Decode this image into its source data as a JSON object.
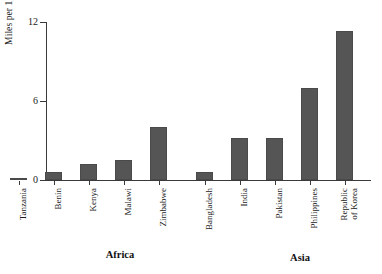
{
  "chart_data": {
    "type": "bar",
    "title": "",
    "subtitle": "",
    "xlabel": "",
    "ylabel": "Miles per 1,000 hectares",
    "ylim": [
      0,
      12
    ],
    "yticks": [
      0,
      6,
      12
    ],
    "ytick_labels": [
      "0",
      "6",
      "12"
    ],
    "grid": false,
    "legend": false,
    "bar_color": "#555555",
    "categories": [
      "Tanzania",
      "Benin",
      "Kenya",
      "Malawi",
      "Zimbabwe",
      "Bangladesh",
      "India",
      "Pakistan",
      "Philippines",
      "Republic of Korea"
    ],
    "values": [
      0.15,
      0.6,
      1.2,
      1.5,
      4.0,
      0.6,
      3.2,
      3.2,
      7.0,
      11.3
    ],
    "groups": [
      {
        "label": "Africa",
        "categories": [
          "Tanzania",
          "Benin",
          "Kenya",
          "Malawi",
          "Zimbabwe"
        ]
      },
      {
        "label": "Asia",
        "categories": [
          "Bangladesh",
          "India",
          "Pakistan",
          "Philippines",
          "Republic of Korea"
        ]
      }
    ]
  },
  "axis": {
    "y_label": "Miles per 1,000 hectares",
    "y_ticks": [
      {
        "value": 12,
        "label": "12"
      },
      {
        "value": 6,
        "label": "6"
      },
      {
        "value": 0,
        "label": "0"
      }
    ]
  },
  "bars": [
    {
      "name": "Tanzania",
      "label": "Tanzania",
      "label_line2": "",
      "value": 0.15
    },
    {
      "name": "Benin",
      "label": "Benin",
      "label_line2": "",
      "value": 0.6
    },
    {
      "name": "Kenya",
      "label": "Kenya",
      "label_line2": "",
      "value": 1.2
    },
    {
      "name": "Malawi",
      "label": "Malawi",
      "label_line2": "",
      "value": 1.5
    },
    {
      "name": "Zimbabwe",
      "label": "Zimbabwe",
      "label_line2": "",
      "value": 4.0
    },
    {
      "name": "Bangladesh",
      "label": "Bangladesh",
      "label_line2": "",
      "value": 0.6
    },
    {
      "name": "India",
      "label": "India",
      "label_line2": "",
      "value": 3.2
    },
    {
      "name": "Pakistan",
      "label": "Pakistan",
      "label_line2": "",
      "value": 3.2
    },
    {
      "name": "Philippines",
      "label": "Philippines",
      "label_line2": "",
      "value": 7.0
    },
    {
      "name": "Republic of Korea",
      "label": "Republic",
      "label_line2": "of Korea",
      "value": 11.3
    }
  ],
  "groups": [
    {
      "label": "Africa"
    },
    {
      "label": "Asia"
    }
  ]
}
